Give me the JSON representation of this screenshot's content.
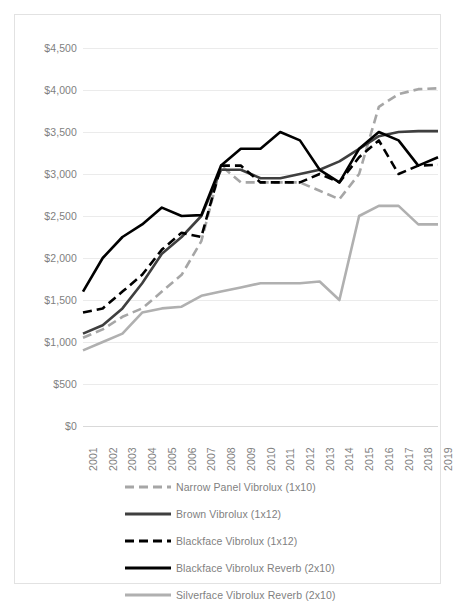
{
  "chart_data": {
    "type": "line",
    "title": "",
    "xlabel": "",
    "ylabel": "",
    "grid": true,
    "legend_position": "bottom",
    "ylim": [
      0,
      4500
    ],
    "ytick_step": 500,
    "ytick_labels": [
      "$4,500",
      "$4,000",
      "$3,500",
      "$3,000",
      "$2,500",
      "$2,000",
      "$1,500",
      "$1,000",
      "$500",
      "$0"
    ],
    "ytick_values": [
      4500,
      4000,
      3500,
      3000,
      2500,
      2000,
      1500,
      1000,
      500,
      0
    ],
    "categories": [
      "2001",
      "2002",
      "2003",
      "2004",
      "2005",
      "2006",
      "2007",
      "2008",
      "2009",
      "2010",
      "2011",
      "2012",
      "2013",
      "2014",
      "2015",
      "2016",
      "2017",
      "2018",
      "2019"
    ],
    "series": [
      {
        "name": "Narrow Panel Vibrolux (1x10)",
        "color": "#a6a6a6",
        "style": "dashed",
        "values": [
          1050,
          1150,
          1300,
          1400,
          1600,
          1800,
          2200,
          3100,
          2900,
          2900,
          2900,
          2900,
          2800,
          2700,
          3000,
          3800,
          3950,
          4010,
          4020
        ]
      },
      {
        "name": "Brown Vibrolux (1x12)",
        "color": "#3f3f3f",
        "style": "solid",
        "values": [
          1100,
          1200,
          1400,
          1700,
          2050,
          2250,
          2500,
          3050,
          3050,
          2950,
          2950,
          3000,
          3050,
          3150,
          3300,
          3450,
          3500,
          3510,
          3510
        ]
      },
      {
        "name": "Blackface Vibrolux (1x12)",
        "color": "#000000",
        "style": "dashed",
        "values": [
          1350,
          1400,
          1600,
          1800,
          2100,
          2300,
          2250,
          3100,
          3100,
          2900,
          2900,
          2900,
          3000,
          2900,
          3200,
          3400,
          3000,
          3100,
          3110
        ]
      },
      {
        "name": "Blackface Vibrolux Reverb (2x10)",
        "color": "#000000",
        "style": "solid",
        "values": [
          1600,
          2000,
          2250,
          2400,
          2600,
          2500,
          2510,
          3100,
          3300,
          3300,
          3500,
          3400,
          3050,
          2900,
          3300,
          3500,
          3400,
          3100,
          3200
        ]
      },
      {
        "name": "Silverface Vibrolux Reverb (2x10)",
        "color": "#b0b0b0",
        "style": "solid",
        "values": [
          900,
          1000,
          1100,
          1350,
          1400,
          1420,
          1550,
          1600,
          1650,
          1700,
          1700,
          1700,
          1720,
          1500,
          2500,
          2620,
          2620,
          2400,
          2400
        ]
      }
    ]
  },
  "legend": {
    "items": [
      {
        "label": "Narrow Panel Vibrolux (1x10)"
      },
      {
        "label": "Brown Vibrolux (1x12)"
      },
      {
        "label": "Blackface Vibrolux (1x12)"
      },
      {
        "label": "Blackface Vibrolux Reverb (2x10)"
      },
      {
        "label": "Silverface Vibrolux Reverb (2x10)"
      }
    ]
  }
}
